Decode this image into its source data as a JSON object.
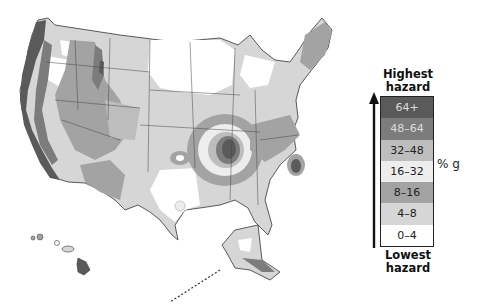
{
  "map": {
    "subject": "Seismic hazard map of the United States (peak ground acceleration, % g)",
    "regions_shown": [
      "Contiguous United States",
      "Alaska",
      "Hawaii"
    ],
    "high_hazard_areas": [
      "Pacific coast (California, Oregon, Washington)",
      "Intermountain West (Utah, Idaho, Wyoming, Montana, Nevada)",
      "New Madrid zone (Missouri/Arkansas/Tennessee/Kentucky border)",
      "Charleston, South Carolina",
      "Southern Alaska",
      "Big Island of Hawaii"
    ]
  },
  "legend": {
    "top_label": "Highest hazard",
    "top_label_line1": "Highest",
    "top_label_line2": "hazard",
    "bottom_label_line1": "Lowest",
    "bottom_label_line2": "hazard",
    "unit": "% g",
    "bands": [
      {
        "label": "64+",
        "color": "#5a5a5a"
      },
      {
        "label": "48–64",
        "color": "#7c7c7c"
      },
      {
        "label": "32–48",
        "color": "#bdbdbd"
      },
      {
        "label": "16–32",
        "color": "#ededed"
      },
      {
        "label": "8–16",
        "color": "#a3a3a3"
      },
      {
        "label": "4–8",
        "color": "#d6d6d6"
      },
      {
        "label": "0–4",
        "color": "#ffffff"
      }
    ]
  }
}
